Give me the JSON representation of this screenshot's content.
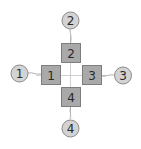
{
  "diagram": {
    "colors": {
      "square_fill": "#a9a9a9",
      "square_stroke": "#7d7d7d",
      "circle_fill": "#d3d3d3",
      "circle_stroke": "#8a8a8a",
      "connector": "#9a9a9a",
      "crosshair": "#c4c4c4"
    },
    "squares": [
      {
        "id": "1",
        "label": "1"
      },
      {
        "id": "2",
        "label": "2"
      },
      {
        "id": "3",
        "label": "3"
      },
      {
        "id": "4",
        "label": "4"
      }
    ],
    "circles": [
      {
        "id": "1",
        "label": "1"
      },
      {
        "id": "2",
        "label": "2"
      },
      {
        "id": "3",
        "label": "3"
      },
      {
        "id": "4",
        "label": "4"
      }
    ]
  }
}
